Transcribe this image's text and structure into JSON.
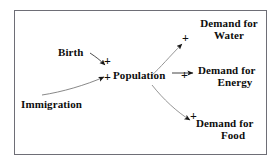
{
  "diagram": {
    "border_color": "#6e6e76",
    "text_color": "#0d0d0d",
    "background": "#ffffff",
    "nodes": [
      {
        "id": "birth",
        "label": "Birth"
      },
      {
        "id": "immigration",
        "label": "Immigration"
      },
      {
        "id": "population",
        "label": "Population"
      },
      {
        "id": "water",
        "label_line1": "Demand for",
        "label_line2": "Water"
      },
      {
        "id": "energy",
        "label_line1": "Demand for",
        "label_line2": "Energy"
      },
      {
        "id": "food",
        "label_line1": "Demand for",
        "label_line2": "Food"
      }
    ],
    "links": [
      {
        "id": "birth-population",
        "from": "Birth",
        "to": "Population",
        "polarity": "+"
      },
      {
        "id": "immigration-population",
        "from": "Immigration",
        "to": "Population",
        "polarity": "+"
      },
      {
        "id": "population-water",
        "from": "Population",
        "to": "Demand for Water",
        "polarity": "+"
      },
      {
        "id": "population-energy",
        "from": "Population",
        "to": "Demand for Energy",
        "polarity": "+"
      },
      {
        "id": "population-food",
        "from": "Population",
        "to": "Demand for Food",
        "polarity": "+"
      }
    ]
  }
}
